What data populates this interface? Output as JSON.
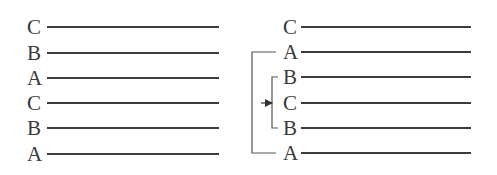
{
  "diagram": {
    "type": "layer-sequence-comparison",
    "left_panel": {
      "rows": [
        {
          "label": "C",
          "y": 27
        },
        {
          "label": "B",
          "y": 53
        },
        {
          "label": "A",
          "y": 78
        },
        {
          "label": "C",
          "y": 103
        },
        {
          "label": "B",
          "y": 128
        },
        {
          "label": "A",
          "y": 154
        }
      ],
      "label_x": 27,
      "line_x1": 47,
      "line_x2": 219
    },
    "right_panel": {
      "rows": [
        {
          "label": "C",
          "y": 27
        },
        {
          "label": "A",
          "y": 52
        },
        {
          "label": "B",
          "y": 77
        },
        {
          "label": "C",
          "y": 103
        },
        {
          "label": "B",
          "y": 128
        },
        {
          "label": "A",
          "y": 153
        }
      ],
      "label_x": 283,
      "line_x1": 301,
      "line_x2": 471,
      "outer_bracket": {
        "x": 252,
        "y1": 52,
        "y2": 153,
        "tick_x2": 276,
        "spans": [
          "A",
          "A"
        ]
      },
      "inner_bracket": {
        "x": 272,
        "y1": 77,
        "y2": 128,
        "tick_x2": 278,
        "spans": [
          "B",
          "B"
        ]
      },
      "arrow": {
        "from_x": 261,
        "to_x": 272,
        "y": 103,
        "points_to": "C"
      }
    },
    "colors": {
      "line": "#3c3c3c",
      "text": "#3a3a3a",
      "bracket": "#555555",
      "background": "#ffffff"
    }
  }
}
